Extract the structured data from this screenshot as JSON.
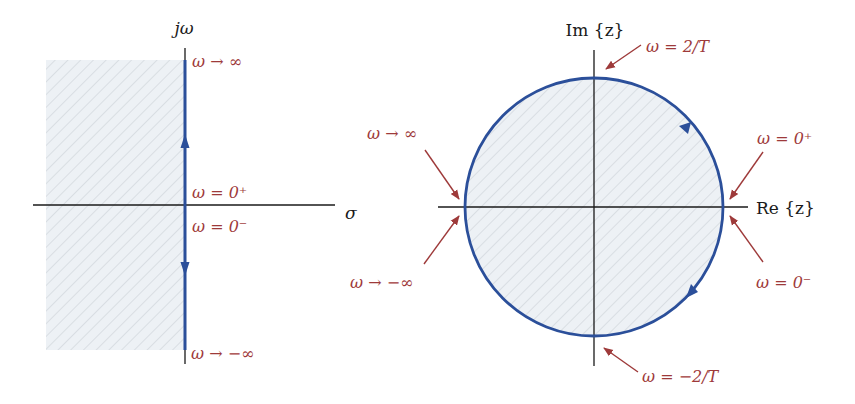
{
  "colors": {
    "contour": "#2b4f9a",
    "axis": "#1a1a1a",
    "label": "#9e3a3a",
    "hatch_fill": "#edf1f5",
    "hatch_line": "#c7ccd2"
  },
  "s_plane": {
    "vertical_axis_label": "jω",
    "horizontal_axis_label": "σ",
    "labels": {
      "top": "ω → ∞",
      "zero_plus": "ω = 0⁺",
      "zero_minus": "ω = 0⁻",
      "bottom": "ω → −∞"
    },
    "shaded_region": "left half-plane"
  },
  "z_plane": {
    "vertical_axis_label": "Im {z}",
    "horizontal_axis_label": "Re {z}",
    "labels": {
      "top": "ω = 2/T",
      "bottom": "ω = −2/T",
      "right_upper": "ω = 0⁺",
      "right_lower": "ω = 0⁻",
      "left_upper": "ω → ∞",
      "left_lower": "ω → −∞"
    },
    "shaded_region": "unit circle interior"
  }
}
